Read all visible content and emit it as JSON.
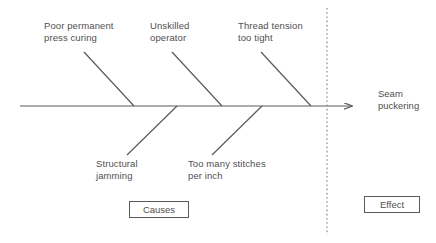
{
  "diagram": {
    "type": "fishbone-cause-and-effect",
    "colors": {
      "line": "#5a5a5a",
      "text": "#4f4f4f",
      "background": "#ffffff",
      "divider": "#8a8a8a"
    },
    "spine": {
      "x1": 20,
      "y1": 106,
      "x2": 358,
      "y2": 106,
      "arrowhead": true
    },
    "divider": {
      "x": 327,
      "y1": 8,
      "y2": 235,
      "style": "dotted"
    },
    "causes": [
      {
        "label": "Poor permanent\npress curing",
        "position": "upper",
        "bone": {
          "x1": 84,
          "y1": 52,
          "x2": 134,
          "y2": 106
        }
      },
      {
        "label": "Unskilled\noperator",
        "position": "upper",
        "bone": {
          "x1": 172,
          "y1": 52,
          "x2": 222,
          "y2": 106
        }
      },
      {
        "label": "Thread tension\ntoo tight",
        "position": "upper",
        "bone": {
          "x1": 261,
          "y1": 52,
          "x2": 311,
          "y2": 106
        }
      },
      {
        "label": "Structural\njamming",
        "position": "lower",
        "bone": {
          "x1": 127,
          "y1": 155,
          "x2": 177,
          "y2": 106
        }
      },
      {
        "label": "Too many stitches\nper inch",
        "position": "lower",
        "bone": {
          "x1": 212,
          "y1": 155,
          "x2": 262,
          "y2": 106
        }
      }
    ],
    "effect": {
      "label": "Seam\npuckering"
    },
    "tags": {
      "causes_label": "Causes",
      "effect_label": "Effect"
    }
  }
}
